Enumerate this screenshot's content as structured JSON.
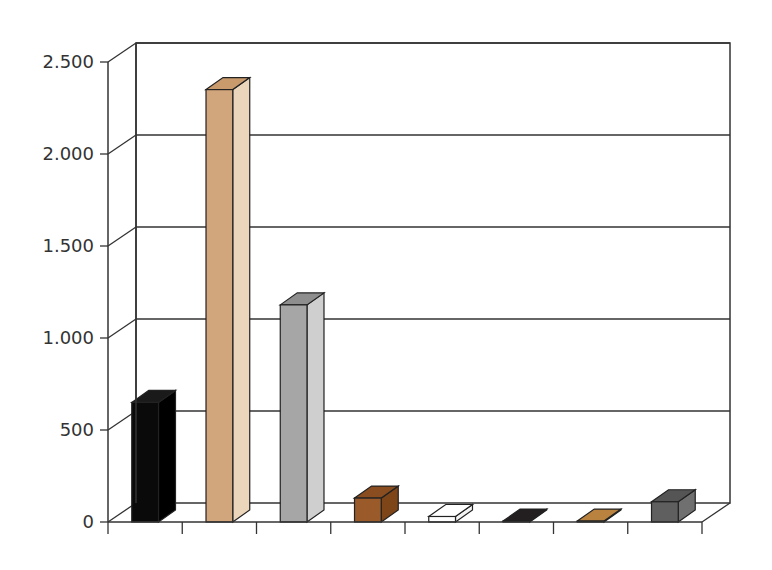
{
  "chart_data": {
    "type": "bar",
    "style": "3d-column",
    "title": "",
    "xlabel": "",
    "ylabel": "",
    "ylim": [
      0,
      2500
    ],
    "yticks": [
      0,
      500,
      1000,
      1500,
      2000,
      2500
    ],
    "ytick_labels": [
      "0",
      "500",
      "1.000",
      "1.500",
      "2.000",
      "2.500"
    ],
    "grid": true,
    "legend": null,
    "categories": [
      "1",
      "2",
      "3",
      "4",
      "5",
      "6",
      "7",
      "8"
    ],
    "category_labels_visible": false,
    "values": [
      650,
      2350,
      1180,
      130,
      30,
      5,
      5,
      110
    ],
    "colors": [
      "#0a0a0a",
      "#d2a67c",
      "#a6a6a6",
      "#9a5a2a",
      "#ffffff",
      "#231f20",
      "#b9823f",
      "#5f5f5f"
    ],
    "side_colors": [
      "#000000",
      "#ecd6bb",
      "#cfcfcf",
      "#7d4518",
      "#f4f4f4",
      "#231f20",
      "#b9823f",
      "#707070"
    ],
    "top_colors": [
      "#1a1a1a",
      "#c99a6c",
      "#8e8e8e",
      "#8a4d1f",
      "#ffffff",
      "#231f20",
      "#b9823f",
      "#555555"
    ]
  }
}
